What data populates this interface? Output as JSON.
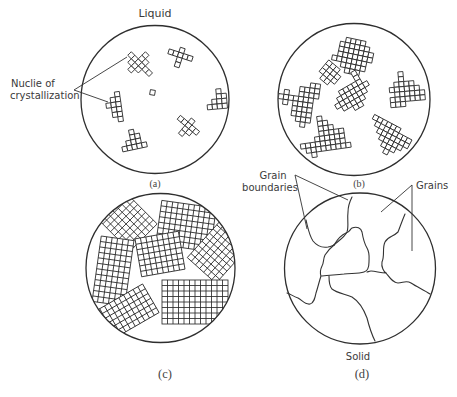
{
  "figure": {
    "panels": [
      {
        "id": "a",
        "caption": "(a)",
        "top_label": "Liquid",
        "stage": "nuclei forming in liquid"
      },
      {
        "id": "b",
        "caption": "(b)",
        "stage": "crystals growing"
      },
      {
        "id": "c",
        "caption": "(c)",
        "stage": "crystals impinging"
      },
      {
        "id": "d",
        "caption": "(d)",
        "bottom_label": "Solid",
        "stage": "solid with grains"
      }
    ],
    "annotations": {
      "nuclei_line1": "Nuclie of",
      "nuclei_line2": "crystallization",
      "grain_boundaries_line1": "Grain",
      "grain_boundaries_line2": "boundaries",
      "grains": "Grains"
    },
    "colors": {
      "line": "#2e2e2e",
      "text": "#3a3a3a",
      "background": "#ffffff"
    }
  }
}
